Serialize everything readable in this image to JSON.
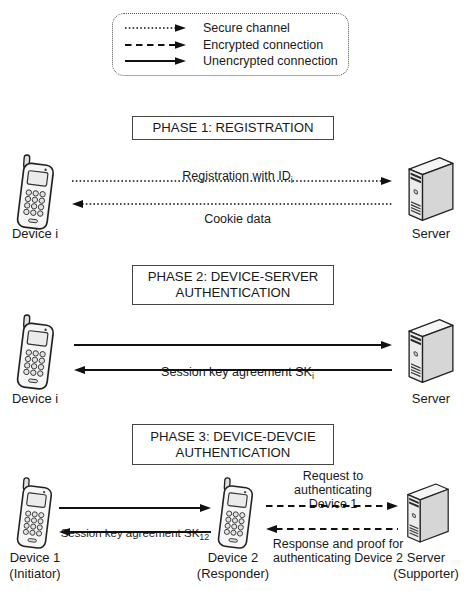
{
  "legend": {
    "items": [
      {
        "label": "Secure channel",
        "style": "dotted"
      },
      {
        "label": "Encrypted connection",
        "style": "dashed"
      },
      {
        "label": "Unencrypted connection",
        "style": "solid"
      }
    ]
  },
  "phase1": {
    "title": "PHASE 1: REGISTRATION",
    "top_message": {
      "text": "Registration with ID",
      "sub": "i"
    },
    "bottom_message": "Cookie data",
    "left_entity": "Device i",
    "right_entity": "Server"
  },
  "phase2": {
    "title": "PHASE 2: DEVICE-SERVER\nAUTHENTICATION",
    "message": {
      "text": "Session key agreement SK",
      "sub": "i"
    },
    "left_entity": "Device i",
    "right_entity": "Server"
  },
  "phase3": {
    "title": "PHASE 3: DEVICE-DEVCIE\nAUTHENTICATION",
    "left_message": {
      "text": "Session key agreement SK",
      "sub": "12"
    },
    "right_top_message": "Request to authenticating\nDevice 1",
    "right_bottom_message": "Response and proof for\nauthenticating Device 2",
    "entity1": "Device 1\n(Initiator)",
    "entity2": "Device 2\n(Responder)",
    "entity3": "Server\n(Supporter)"
  },
  "colors": {
    "line": "#111111",
    "text": "#1a1a1a",
    "background": "#ffffff"
  }
}
